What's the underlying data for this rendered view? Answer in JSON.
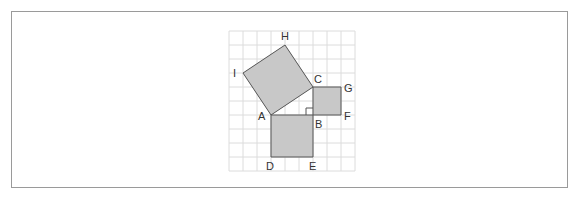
{
  "figure": {
    "grid": {
      "origin_x": 229,
      "origin_y": 31,
      "cell": 14,
      "cols": 9,
      "rows": 10,
      "line_color": "#dcdcdc"
    },
    "colors": {
      "fill": "#c8c8c8",
      "stroke": "#555555",
      "label": "#333333",
      "frame": "#9a9a9a"
    },
    "squares": [
      {
        "name": "square-ACHI",
        "points": "271,115 313,87 285,45 243,73"
      },
      {
        "name": "square-BCGF",
        "points": "313,87 341,87 341,115 313,115"
      },
      {
        "name": "square-ABED",
        "points": "271,115 313,115 313,157 271,157"
      }
    ],
    "right_angle_marker": "306,115 306,108 313,108",
    "labels": [
      {
        "text": "H",
        "x": 281,
        "y": 40
      },
      {
        "text": "I",
        "x": 233,
        "y": 77
      },
      {
        "text": "C",
        "x": 314,
        "y": 83
      },
      {
        "text": "G",
        "x": 344,
        "y": 92
      },
      {
        "text": "A",
        "x": 258,
        "y": 120
      },
      {
        "text": "B",
        "x": 315,
        "y": 128
      },
      {
        "text": "F",
        "x": 344,
        "y": 120
      },
      {
        "text": "D",
        "x": 266,
        "y": 170
      },
      {
        "text": "E",
        "x": 309,
        "y": 170
      }
    ]
  }
}
